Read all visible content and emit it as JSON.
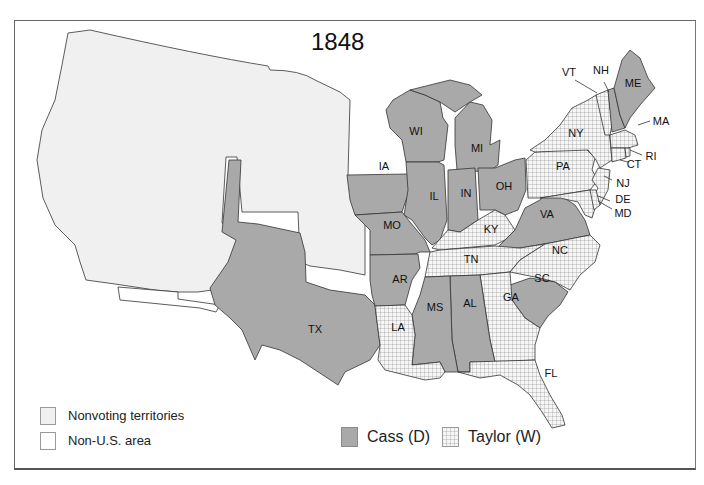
{
  "map": {
    "title": "1848",
    "colors": {
      "cass": "#a9a9a9",
      "taylor_bg": "#f6f6f6",
      "taylor_grid": "#8a8a8a",
      "nonvoting": "#f0f0f0",
      "non_us": "#ffffff",
      "border": "#333333"
    },
    "states": [
      {
        "abbr": "WI",
        "winner": "Cass"
      },
      {
        "abbr": "MI",
        "winner": "Cass"
      },
      {
        "abbr": "IA",
        "winner": "Cass"
      },
      {
        "abbr": "IL",
        "winner": "Cass"
      },
      {
        "abbr": "IN",
        "winner": "Cass"
      },
      {
        "abbr": "OH",
        "winner": "Cass"
      },
      {
        "abbr": "MO",
        "winner": "Cass"
      },
      {
        "abbr": "AR",
        "winner": "Cass"
      },
      {
        "abbr": "TX",
        "winner": "Cass"
      },
      {
        "abbr": "MS",
        "winner": "Cass"
      },
      {
        "abbr": "AL",
        "winner": "Cass"
      },
      {
        "abbr": "SC",
        "winner": "Cass"
      },
      {
        "abbr": "VA",
        "winner": "Cass"
      },
      {
        "abbr": "ME",
        "winner": "Cass"
      },
      {
        "abbr": "NH",
        "winner": "Cass"
      },
      {
        "abbr": "VT",
        "winner": "Taylor"
      },
      {
        "abbr": "NY",
        "winner": "Taylor"
      },
      {
        "abbr": "MA",
        "winner": "Taylor"
      },
      {
        "abbr": "RI",
        "winner": "Taylor"
      },
      {
        "abbr": "CT",
        "winner": "Taylor"
      },
      {
        "abbr": "PA",
        "winner": "Taylor"
      },
      {
        "abbr": "NJ",
        "winner": "Taylor"
      },
      {
        "abbr": "DE",
        "winner": "Taylor"
      },
      {
        "abbr": "MD",
        "winner": "Taylor"
      },
      {
        "abbr": "KY",
        "winner": "Taylor"
      },
      {
        "abbr": "TN",
        "winner": "Taylor"
      },
      {
        "abbr": "NC",
        "winner": "Taylor"
      },
      {
        "abbr": "GA",
        "winner": "Taylor"
      },
      {
        "abbr": "FL",
        "winner": "Taylor"
      },
      {
        "abbr": "LA",
        "winner": "Taylor"
      }
    ]
  },
  "labels": {
    "WI": "WI",
    "MI": "MI",
    "IA": "IA",
    "IL": "IL",
    "IN": "IN",
    "OH": "OH",
    "MO": "MO",
    "AR": "AR",
    "TX": "TX",
    "MS": "MS",
    "AL": "AL",
    "SC": "SC",
    "VA": "VA",
    "ME": "ME",
    "NH": "NH",
    "VT": "VT",
    "NY": "NY",
    "MA": "MA",
    "RI": "RI",
    "CT": "CT",
    "PA": "PA",
    "NJ": "NJ",
    "DE": "DE",
    "MD": "MD",
    "KY": "KY",
    "TN": "TN",
    "NC": "NC",
    "GA": "GA",
    "FL": "FL",
    "LA": "LA"
  },
  "legend": {
    "nonvoting": "Nonvoting territories",
    "non_us": "Non-U.S. area",
    "cass": "Cass (D)",
    "taylor": "Taylor (W)"
  }
}
